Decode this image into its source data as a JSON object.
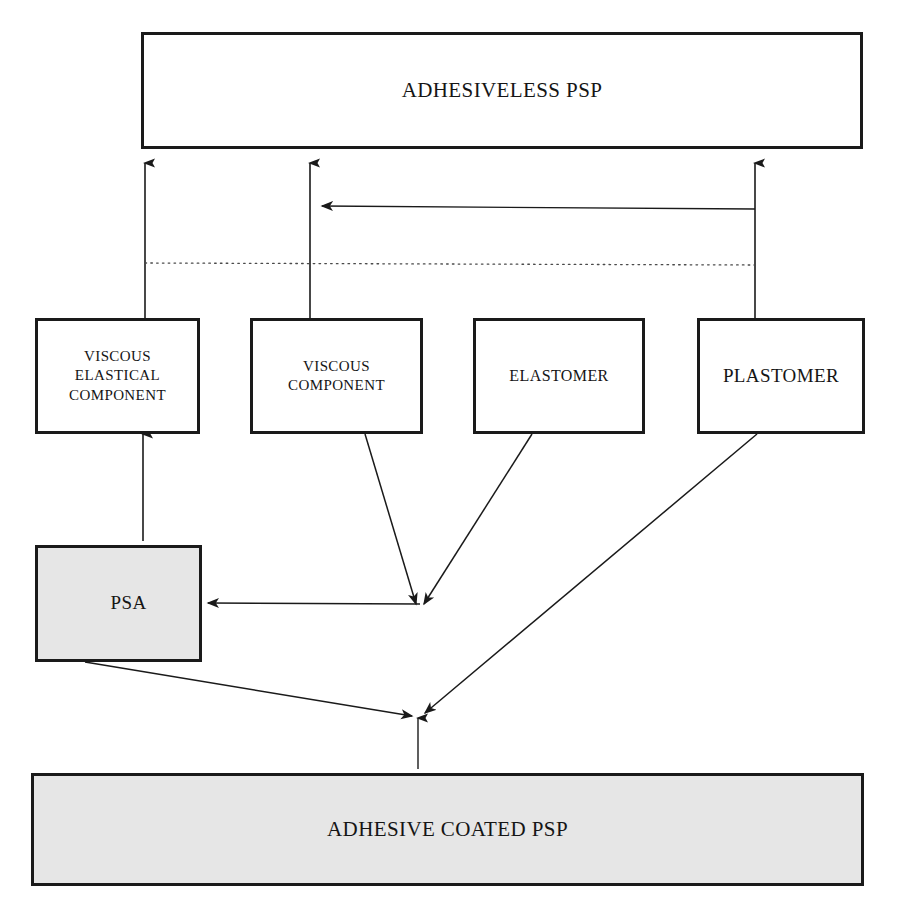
{
  "diagram": {
    "background_color": "#ffffff",
    "line_color": "#1a1a1a",
    "shade_color": "#e6e6e6",
    "nodes": {
      "adhesiveless_psp": {
        "label": "ADHESIVELESS PSP",
        "fill": "white"
      },
      "viscous_elastical_component": {
        "label": "VISCOUS\nELASTICAL\nCOMPONENT",
        "fill": "white"
      },
      "viscous_component": {
        "label": "VISCOUS\nCOMPONENT",
        "fill": "white"
      },
      "elastomer": {
        "label": "ELASTOMER",
        "fill": "white"
      },
      "plastomer": {
        "label": "PLASTOMER",
        "fill": "white"
      },
      "psa": {
        "label": "PSA",
        "fill": "shaded"
      },
      "adhesive_coated_psp": {
        "label": "ADHESIVE COATED PSP",
        "fill": "shaded"
      }
    },
    "edges": [
      {
        "id": "e1",
        "from": "viscous_elastical_component",
        "to": "adhesiveless_psp",
        "style": "solid",
        "arrow": "up"
      },
      {
        "id": "e2",
        "from": "viscous_component",
        "to": "adhesiveless_psp",
        "style": "solid",
        "arrow": "up"
      },
      {
        "id": "e3",
        "from": "plastomer",
        "to": "adhesiveless_psp",
        "style": "solid",
        "arrow": "up"
      },
      {
        "id": "e4",
        "from": "plastomer",
        "to": "viscous_component",
        "style": "solid",
        "arrow": "left"
      },
      {
        "id": "e5",
        "from": "viscous_elastical_component",
        "to": "plastomer",
        "style": "dotted",
        "arrow": "none"
      },
      {
        "id": "e6",
        "from": "viscous_elastical_component",
        "to": "psa",
        "style": "solid",
        "arrow": "down"
      },
      {
        "id": "e7",
        "from": "viscous_component",
        "to": "junction_psa",
        "style": "solid",
        "arrow": "down"
      },
      {
        "id": "e8",
        "from": "elastomer",
        "to": "junction_psa",
        "style": "solid",
        "arrow": "down"
      },
      {
        "id": "e9",
        "from": "junction_psa",
        "to": "psa",
        "style": "solid",
        "arrow": "left"
      },
      {
        "id": "e10",
        "from": "psa",
        "to": "junction_bottom",
        "style": "solid",
        "arrow": "right"
      },
      {
        "id": "e11",
        "from": "plastomer",
        "to": "junction_bottom",
        "style": "solid",
        "arrow": "left"
      },
      {
        "id": "e12",
        "from": "junction_bottom",
        "to": "adhesive_coated_psp",
        "style": "solid",
        "arrow": "down"
      }
    ]
  }
}
